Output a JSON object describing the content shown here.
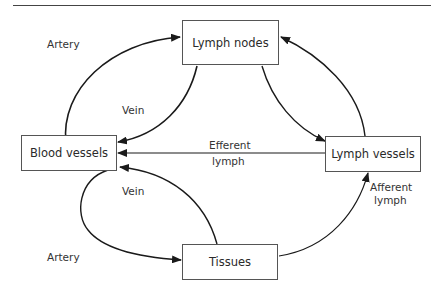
{
  "diagram": {
    "title": "",
    "nodes": [
      {
        "id": "lymph_nodes",
        "label": "Lymph nodes"
      },
      {
        "id": "blood_vessels",
        "label": "Blood vessels"
      },
      {
        "id": "lymph_vessels",
        "label": "Lymph vessels"
      },
      {
        "id": "tissues",
        "label": "Tissues"
      }
    ],
    "edges": [
      {
        "from": "blood_vessels",
        "to": "lymph_nodes",
        "label": "Artery"
      },
      {
        "from": "lymph_nodes",
        "to": "blood_vessels",
        "label": "Vein"
      },
      {
        "from": "lymph_nodes",
        "to": "lymph_vessels",
        "label": ""
      },
      {
        "from": "lymph_vessels",
        "to": "lymph_nodes",
        "label": ""
      },
      {
        "from": "lymph_vessels",
        "to": "blood_vessels",
        "label": "Efferent lymph"
      },
      {
        "from": "blood_vessels",
        "to": "tissues",
        "label": "Artery"
      },
      {
        "from": "tissues",
        "to": "blood_vessels",
        "label": "Vein"
      },
      {
        "from": "tissues",
        "to": "lymph_vessels",
        "label": "Afferent lymph"
      }
    ],
    "labels": {
      "artery_top": "Artery",
      "vein_top": "Vein",
      "efferent_line1": "Efferent",
      "efferent_line2": "lymph",
      "vein_bottom": "Vein",
      "artery_bottom": "Artery",
      "afferent_line1": "Afferent",
      "afferent_line2": "lymph"
    }
  }
}
